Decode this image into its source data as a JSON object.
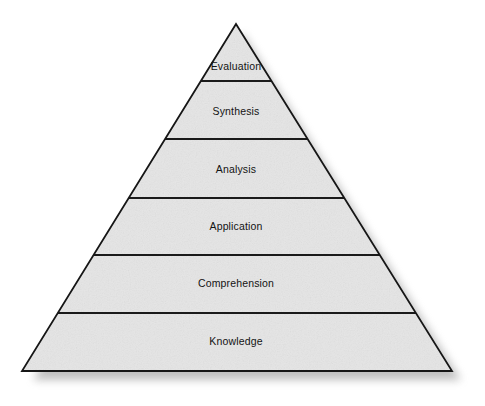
{
  "diagram": {
    "name": "blooms-taxonomy-pyramid",
    "type": "pyramid",
    "background_color": "#ffffff",
    "fill_color": "#e4e4e4",
    "stroke_color": "#1a1a1a",
    "text_color": "#131313",
    "shadow_color": "#9a9a9a",
    "apex": {
      "x": 236,
      "y": 24
    },
    "base_left": {
      "x": 22,
      "y": 371
    },
    "base_right": {
      "x": 452,
      "y": 371
    },
    "levels": [
      {
        "label": "Evaluation",
        "order": 6,
        "label_x": 236,
        "label_y": 67,
        "top_y": 24,
        "bottom_y": 81
      },
      {
        "label": "Synthesis",
        "order": 5,
        "label_x": 236,
        "label_y": 112,
        "top_y": 81,
        "bottom_y": 139
      },
      {
        "label": "Analysis",
        "order": 4,
        "label_x": 236,
        "label_y": 170,
        "top_y": 139,
        "bottom_y": 198
      },
      {
        "label": "Application",
        "order": 3,
        "label_x": 236,
        "label_y": 227,
        "top_y": 198,
        "bottom_y": 255
      },
      {
        "label": "Comprehension",
        "order": 2,
        "label_x": 236,
        "label_y": 284,
        "top_y": 255,
        "bottom_y": 313
      },
      {
        "label": "Knowledge",
        "order": 1,
        "label_x": 236,
        "label_y": 342,
        "top_y": 313,
        "bottom_y": 371
      }
    ],
    "divider_ys": [
      81,
      139,
      198,
      255,
      313
    ]
  }
}
